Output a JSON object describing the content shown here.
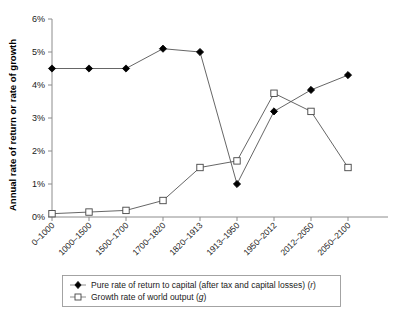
{
  "chart_data": {
    "type": "line",
    "title": "",
    "xlabel": "",
    "ylabel": "Annual rate of return or rate of growth",
    "categories": [
      "0–1000",
      "1000–1500",
      "1500–1700",
      "1700–1820",
      "1820–1913",
      "1913–1950",
      "1950–2012",
      "2012–2050",
      "2050–2100"
    ],
    "ylim": [
      0,
      6
    ],
    "ytick_labels": [
      "0%",
      "1%",
      "2%",
      "3%",
      "4%",
      "5%",
      "6%"
    ],
    "ytick_values": [
      0,
      1,
      2,
      3,
      4,
      5,
      6
    ],
    "grid": false,
    "legend_position": "bottom",
    "series": [
      {
        "name": "Pure rate of return to capital (after tax and capital losses) (r)",
        "marker": "filled-diamond",
        "values": [
          4.5,
          4.5,
          4.5,
          5.1,
          5.0,
          1.0,
          3.2,
          3.85,
          4.3
        ]
      },
      {
        "name": "Growth rate of world output (g)",
        "marker": "open-square",
        "values": [
          0.1,
          0.15,
          0.2,
          0.5,
          1.5,
          1.7,
          3.75,
          3.2,
          1.5
        ]
      }
    ]
  },
  "legend": {
    "items": [
      {
        "marker_name": "legend-marker-filled-diamond",
        "label_main": "Pure rate of return to capital (after tax and capital losses) (",
        "label_symbol": "r",
        "label_tail": ")"
      },
      {
        "marker_name": "legend-marker-open-square",
        "label_main": "Growth rate of world output (",
        "label_symbol": "g",
        "label_tail": ")"
      }
    ]
  },
  "colors": {
    "series_r": "#000000",
    "series_g": "#ffffff",
    "line": "#555555",
    "axis": "#8c8c8c",
    "background": "#ffffff"
  }
}
